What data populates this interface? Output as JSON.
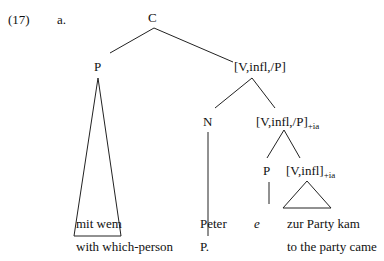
{
  "example": {
    "number": "(17)",
    "letter": "a."
  },
  "tree": {
    "root": "C",
    "left_p": "P",
    "vp1": "[V,infl,/P]",
    "n": "N",
    "vp2": "[V,infl,/P]",
    "vp2_sub": "+ia",
    "p2": "P",
    "v3": "[V,infl]",
    "v3_sub": "+ia"
  },
  "leaves": {
    "mitwem": "mit wem",
    "peter": "Peter",
    "e": "e",
    "zurparty": "zur Party kam"
  },
  "gloss": {
    "mitwem": "with which-person",
    "peter": "P.",
    "zurparty": "to the party came"
  }
}
